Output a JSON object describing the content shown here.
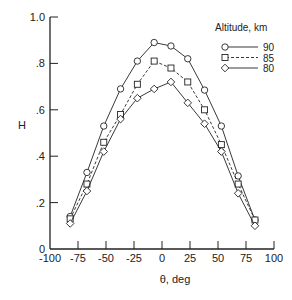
{
  "chart_data": {
    "type": "line",
    "title": "",
    "xlabel": "θ,  deg",
    "ylabel": "H",
    "xlim": [
      -100,
      100
    ],
    "ylim": [
      0,
      1.0
    ],
    "grid": false,
    "x_ticks": [
      -100,
      -75,
      -50,
      -25,
      0,
      25,
      50,
      75,
      100
    ],
    "x_tick_labels": [
      "-100",
      "-75",
      "-50",
      "-25",
      "0",
      "25",
      "50",
      "75",
      "100"
    ],
    "y_ticks": [
      0,
      0.2,
      0.4,
      0.6,
      0.8,
      1.0
    ],
    "y_tick_labels": [
      "0",
      ".2",
      ".4",
      ".6",
      ".8",
      "1.0"
    ],
    "legend": {
      "title": "Altitude,  km",
      "position": "upper right"
    },
    "x": [
      -82,
      -67,
      -52,
      -37,
      -22,
      -7,
      8,
      23,
      38,
      53,
      68,
      83
    ],
    "series": [
      {
        "name": "90",
        "marker": "circle",
        "line": "solid",
        "values": [
          0.14,
          0.33,
          0.53,
          0.69,
          0.81,
          0.89,
          0.875,
          0.82,
          0.685,
          0.53,
          0.315,
          0.125
        ]
      },
      {
        "name": "85",
        "marker": "square",
        "line": "dashed",
        "values": [
          0.13,
          0.28,
          0.46,
          0.58,
          0.71,
          0.81,
          0.78,
          0.72,
          0.6,
          0.45,
          0.28,
          0.125
        ]
      },
      {
        "name": "80",
        "marker": "diamond",
        "line": "solid",
        "values": [
          0.11,
          0.25,
          0.42,
          0.56,
          0.65,
          0.69,
          0.72,
          0.63,
          0.54,
          0.42,
          0.24,
          0.1
        ]
      }
    ]
  },
  "colors": {
    "ink": "#222222",
    "background": "#ffffff"
  }
}
